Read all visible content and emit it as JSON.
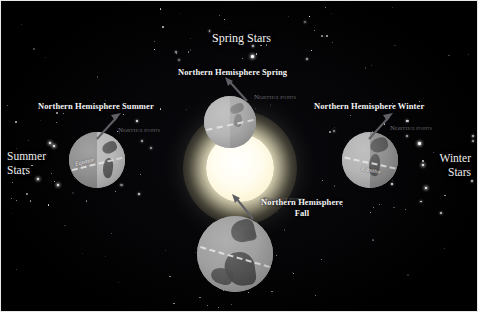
{
  "figure": {
    "name": "earth-orbit-seasons-diagram",
    "background_color": "#000000",
    "sun_color": "#fffdf0",
    "earth_lit_color": "#b9b9b9",
    "earth_dark_color": "#777777",
    "label_color": "#f4f4f4",
    "axis_label_color": "#6f6f74"
  },
  "star_fields": {
    "spring": {
      "label": "Spring Stars"
    },
    "summer": {
      "line1": "Summer",
      "line2": "Stars"
    },
    "winter": {
      "line1": "Winter",
      "line2": "Stars"
    }
  },
  "positions": [
    {
      "key": "spring",
      "heading": "Northern Hemisphere Spring",
      "axis_label_main": "North",
      "axis_label_small": "ce",
      "axis_label_tail": "Points",
      "equator_label": "Equator"
    },
    {
      "key": "summer",
      "heading": "Northern Hemisphere Summer",
      "axis_label_main": "North",
      "axis_label_small": "ce",
      "axis_label_tail": "Points",
      "equator_label": "Equator"
    },
    {
      "key": "fall",
      "heading_line1": "Northern Hemisphere",
      "heading_line2": "Fall",
      "axis_label_main": "North",
      "axis_label_small": "ce",
      "axis_label_tail": "Points",
      "equator_label": "Equator"
    },
    {
      "key": "winter",
      "heading": "Northern Hemisphere Winter",
      "axis_label_main": "North",
      "axis_label_small": "ce",
      "axis_label_tail": "Points",
      "equator_label": "Equator"
    }
  ],
  "chart_data": {
    "type": "diagram",
    "center_body": "Sun",
    "orbiting_body": "Earth",
    "orbit_positions": 4,
    "items": [
      {
        "season": "Spring",
        "earth_position": "top",
        "stars_visible": "Spring Stars",
        "stars_direction": "up"
      },
      {
        "season": "Summer",
        "earth_position": "left",
        "stars_visible": "Summer Stars",
        "stars_direction": "left"
      },
      {
        "season": "Fall",
        "earth_position": "bottom",
        "stars_visible": "",
        "stars_direction": "down"
      },
      {
        "season": "Winter",
        "earth_position": "right",
        "stars_visible": "Winter Stars",
        "stars_direction": "right"
      }
    ]
  }
}
